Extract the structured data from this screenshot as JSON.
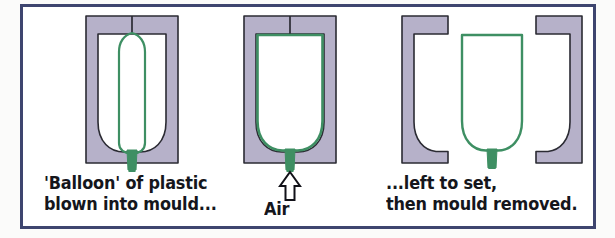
{
  "figure": {
    "frame_color": "#3e456f",
    "background_color": "#ffffff",
    "page_background_color": "#fbfbfa"
  },
  "colors": {
    "mould_fill": "#b6b1c9",
    "mould_outline": "#2b2b33",
    "cavity_fill": "#ffffff",
    "plastic_green": "#3e8f63",
    "text": "#15161c",
    "arrow_outline": "#111118",
    "arrow_fill": "#ffffff"
  },
  "panels": [
    {
      "id": "panel-1",
      "name": "balloon-in-mould",
      "caption_lines": [
        "'Balloon' of plastic",
        "blown into mould..."
      ],
      "elements": [
        "mould-body",
        "mould-cavity",
        "mould-split-line",
        "plastic-balloon",
        "plastic-stem"
      ]
    },
    {
      "id": "panel-2",
      "name": "air-blown-mould",
      "caption_lines": [
        "Air"
      ],
      "elements": [
        "mould-body",
        "mould-cavity",
        "mould-split-line",
        "plastic-shell",
        "plastic-stem",
        "air-arrow"
      ]
    },
    {
      "id": "panel-3",
      "name": "mould-removed",
      "caption_lines": [
        "...left to set,",
        "then mould removed."
      ],
      "elements": [
        "mould-half-left",
        "mould-half-right",
        "finished-bottle",
        "plastic-stem"
      ]
    }
  ],
  "captions": {
    "panel1_line1": "'Balloon' of plastic",
    "panel1_line2": "blown into mould...",
    "panel2_line1": "Air",
    "panel3_line1": "...left to set,",
    "panel3_line2": "then mould removed."
  },
  "labels": {
    "air_arrow_direction": "up",
    "air_arrow_label": "Air"
  }
}
